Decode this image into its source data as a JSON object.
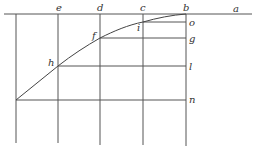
{
  "diagram": {
    "labels": {
      "a": "a",
      "b": "b",
      "c": "c",
      "d": "d",
      "e": "e",
      "f": "f",
      "g": "g",
      "h": "h",
      "i": "i",
      "l": "l",
      "n": "n",
      "o": "o"
    },
    "colors": {
      "line": "#555555",
      "curve": "#444444",
      "text": "#333333",
      "background": "#ffffff"
    }
  }
}
